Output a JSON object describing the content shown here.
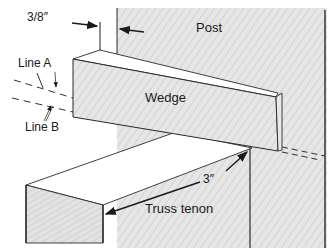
{
  "diagram": {
    "type": "technical-illustration",
    "labels": {
      "post": "Post",
      "wedge": "Wedge",
      "truss_tenon": "Truss tenon",
      "line_a": "Line A",
      "line_b": "Line B",
      "dim_wedge_offset": "3/8″",
      "dim_tenon_length": "3″"
    },
    "colors": {
      "outline": "#2a2a2a",
      "wood_fill": "#e4e4e4",
      "wood_fill_dark": "#d6d6d6",
      "top_face": "#ffffff",
      "background": "#ffffff"
    }
  }
}
